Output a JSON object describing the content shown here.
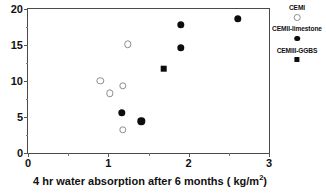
{
  "chart_data": {
    "type": "scatter",
    "title": "",
    "xlabel": "4 hr water absorption after 6 months ( kg/m²)",
    "ylabel": "",
    "xlim": [
      0,
      3
    ],
    "ylim": [
      0,
      20
    ],
    "xticks": [
      0,
      1,
      2,
      3
    ],
    "yticks": [
      0,
      5,
      10,
      15,
      20
    ],
    "xtick_labels": [
      "0",
      "1",
      "2",
      "3"
    ],
    "ytick_labels": [
      "0",
      "5",
      "10",
      "15",
      "20"
    ],
    "x_minor_ticks": [
      0.5,
      1.5,
      2.5
    ],
    "y_minor_ticks": [
      2.5,
      7.5,
      12.5,
      17.5
    ],
    "grid": false,
    "legend_position": "right",
    "series": [
      {
        "name": "CEMI",
        "marker": "open-circle",
        "color": "#8d8d8d",
        "points": [
          {
            "x": 0.9,
            "y": 10.0
          },
          {
            "x": 1.02,
            "y": 8.3
          },
          {
            "x": 1.18,
            "y": 9.3
          },
          {
            "x": 1.24,
            "y": 15.1
          },
          {
            "x": 1.18,
            "y": 3.2
          }
        ]
      },
      {
        "name": "CEMII-limestone",
        "marker": "filled-circle",
        "color": "#0d0d0d",
        "points": [
          {
            "x": 1.17,
            "y": 5.6
          },
          {
            "x": 1.41,
            "y": 4.4
          },
          {
            "x": 1.9,
            "y": 17.8
          },
          {
            "x": 1.9,
            "y": 14.6
          },
          {
            "x": 2.61,
            "y": 18.6
          }
        ]
      },
      {
        "name": "CEMIII-GGBS",
        "marker": "filled-square",
        "color": "#0d0d0d",
        "points": [
          {
            "x": 1.69,
            "y": 11.7
          }
        ]
      }
    ]
  },
  "axis": {
    "x_title_main": "4 hr water absorption after 6 months ( kg/m",
    "x_title_sup": "2",
    "x_title_tail": ")"
  }
}
